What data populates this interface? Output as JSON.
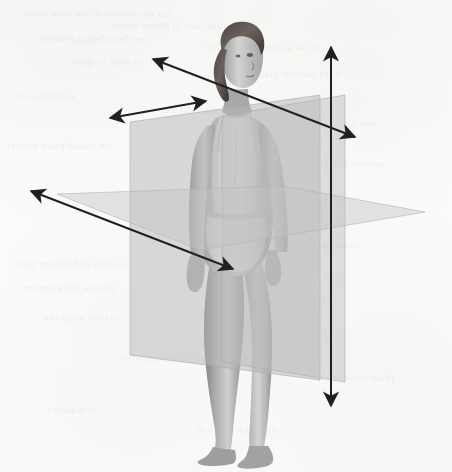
{
  "figure": {
    "background_color": "#fbfbfa",
    "ink_color": "#231f20"
  },
  "planes": [
    {
      "id": "frontal",
      "name": "frontal-coronal-plane",
      "label": "Frontal (coronal) plane",
      "fill": "#b9b9b9",
      "opacity": 0.52,
      "stroke": "#a7a7a7",
      "points": "130,122 320,95 320,380 130,355"
    },
    {
      "id": "sagittal",
      "name": "sagittal-plane",
      "label": "Sagittal (median) plane",
      "fill": "#bcbcbc",
      "opacity": 0.46,
      "stroke": "#ababab",
      "points": "222,116 345,95 345,382 222,362"
    },
    {
      "id": "transverse",
      "name": "transverse-horizontal-plane",
      "label": "Transverse (horizontal) plane",
      "fill": "#c4c4c4",
      "opacity": 0.44,
      "stroke": "#b3b3b3",
      "points": "57,194 283,186 425,212 200,250"
    }
  ],
  "axes": [
    {
      "id": "vertical",
      "name": "vertical-longitudinal-axis",
      "label": "Vertical (longitudinal) axis",
      "x1": 331,
      "y1": 47,
      "x2": 331,
      "y2": 406,
      "arrow_start": true,
      "arrow_end": true
    },
    {
      "id": "sagittal-axis",
      "name": "sagittal-anteroposterior-axis",
      "label": "Sagittal (anteroposterior) axis",
      "x1": 153,
      "y1": 59,
      "x2": 355,
      "y2": 137,
      "arrow_start": true,
      "arrow_end": true
    },
    {
      "id": "frontal-axis",
      "name": "frontal-transverse-axis",
      "label": "Frontal (transverse) axis",
      "x1": 110,
      "y1": 118,
      "x2": 206,
      "y2": 101,
      "arrow_start": true,
      "arrow_end": true
    },
    {
      "id": "oblique-axis",
      "name": "oblique-depth-axis",
      "label": "Oblique depth axis",
      "x1": 31,
      "y1": 191,
      "x2": 233,
      "y2": 269,
      "arrow_start": true,
      "arrow_end": true
    }
  ],
  "bleed_through": [
    {
      "text": "the movements of the body occur",
      "x": 24,
      "y": 8,
      "size": 10,
      "rot": -0.6
    },
    {
      "text": "about axes and in planes which",
      "x": 112,
      "y": 20,
      "size": 10,
      "rot": -0.4
    },
    {
      "text": "are described in relation",
      "x": 40,
      "y": 33,
      "size": 10,
      "rot": -0.5
    },
    {
      "text": "to the anatomical position",
      "x": 206,
      "y": 42,
      "size": 10,
      "rot": -0.3
    },
    {
      "text": "of the body in space",
      "x": 70,
      "y": 56,
      "size": 10,
      "rot": -0.4
    },
    {
      "text": "three cardinal planes",
      "x": 250,
      "y": 68,
      "size": 10,
      "rot": -0.2
    },
    {
      "text": "and three axes",
      "x": 12,
      "y": 90,
      "size": 10,
      "rot": -0.5
    },
    {
      "text": "the sagittal plane divides",
      "x": 160,
      "y": 104,
      "size": 10,
      "rot": -0.3
    },
    {
      "text": "into right and left",
      "x": 300,
      "y": 118,
      "size": 10,
      "rot": -0.2
    },
    {
      "text": "the frontal plane divides",
      "x": 6,
      "y": 140,
      "size": 10,
      "rot": -0.4
    },
    {
      "text": "anterior and posterior",
      "x": 290,
      "y": 158,
      "size": 10,
      "rot": -0.3
    },
    {
      "text": "the transverse plane",
      "x": 196,
      "y": 172,
      "size": 10,
      "rot": -0.2
    },
    {
      "text": "superior and inferior parts",
      "x": 14,
      "y": 258,
      "size": 10,
      "rot": -0.4
    },
    {
      "text": "movement in the sagittal",
      "x": 250,
      "y": 240,
      "size": 10,
      "rot": -0.3
    },
    {
      "text": "flexion and extension",
      "x": 20,
      "y": 282,
      "size": 10,
      "rot": -0.5
    },
    {
      "text": "abduction and adduction",
      "x": 230,
      "y": 296,
      "size": 10,
      "rot": -0.2
    },
    {
      "text": "rotation about the",
      "x": 44,
      "y": 312,
      "size": 10,
      "rot": -0.4
    },
    {
      "text": "longitudinal axis",
      "x": 272,
      "y": 330,
      "size": 10,
      "rot": -0.3
    },
    {
      "text": "circumduction combines",
      "x": 120,
      "y": 352,
      "size": 10,
      "rot": -0.2
    },
    {
      "text": "these movements",
      "x": 318,
      "y": 372,
      "size": 10,
      "rot": -0.4
    },
    {
      "text": "in sequence",
      "x": 46,
      "y": 404,
      "size": 10,
      "rot": -0.3
    },
    {
      "text": "about the centre of",
      "x": 196,
      "y": 424,
      "size": 10,
      "rot": -0.2
    }
  ]
}
